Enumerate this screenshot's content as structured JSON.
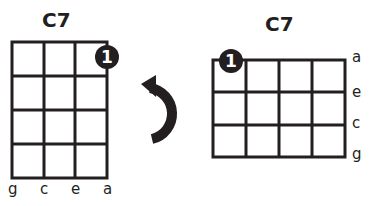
{
  "left_diagram": {
    "title": "C7",
    "orientation": "vertical",
    "strings": [
      "g",
      "c",
      "e",
      "a"
    ],
    "frets_shown": 4,
    "finger_dot": {
      "label": "1",
      "string": "a",
      "fret": 1
    }
  },
  "rotate_arrow": {
    "icon": "rotate-counterclockwise-arrow"
  },
  "right_diagram": {
    "title": "C7",
    "orientation": "horizontal",
    "strings": [
      "a",
      "e",
      "c",
      "g"
    ],
    "frets_shown": 4,
    "finger_dot": {
      "label": "1",
      "string": "a",
      "fret": 1
    }
  },
  "colors": {
    "ink": "#231f20",
    "background": "#ffffff"
  }
}
